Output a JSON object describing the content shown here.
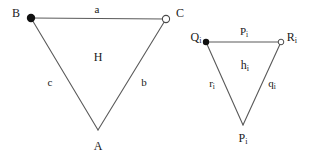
{
  "figure": {
    "background_color": "#ffffff",
    "stroke_color": "#5a5a5a",
    "text_color": "#1a1a1a",
    "left_triangle": {
      "vertices": [
        {
          "name": "B",
          "label": "B",
          "marker": "filled-dot",
          "x": 31,
          "y": 18,
          "label_x": 16,
          "label_y": 13
        },
        {
          "name": "C",
          "label": "C",
          "marker": "open-circle",
          "x": 166,
          "y": 19,
          "label_x": 180,
          "label_y": 13
        },
        {
          "name": "A",
          "label": "A",
          "marker": "none",
          "x": 98,
          "y": 130,
          "label_x": 98,
          "label_y": 146
        }
      ],
      "edges": [
        {
          "name": "a",
          "label": "a",
          "from": "B",
          "to": "C",
          "label_x": 97,
          "label_y": 9
        },
        {
          "name": "b",
          "label": "b",
          "from": "C",
          "to": "A",
          "label_x": 144,
          "label_y": 82
        },
        {
          "name": "c",
          "label": "c",
          "from": "B",
          "to": "A",
          "label_x": 50,
          "label_y": 82
        }
      ],
      "interior_label": {
        "name": "H",
        "label": "H",
        "label_x": 98,
        "label_y": 57
      }
    },
    "right_triangle": {
      "vertices": [
        {
          "name": "Q_i",
          "label": "Q",
          "subscript": "i",
          "marker": "filled-dot",
          "x": 206,
          "y": 42,
          "label_x": 196,
          "label_y": 38
        },
        {
          "name": "R_i",
          "label": "R",
          "subscript": "i",
          "marker": "open-circle",
          "x": 281,
          "y": 42,
          "label_x": 292,
          "label_y": 38
        },
        {
          "name": "P_i",
          "label": "P",
          "subscript": "i",
          "marker": "none",
          "x": 243,
          "y": 125,
          "label_x": 243,
          "label_y": 139
        }
      ],
      "edges": [
        {
          "name": "p_i",
          "label": "P",
          "subscript": "i",
          "from": "Q_i",
          "to": "R_i",
          "label_x": 244,
          "label_y": 32
        },
        {
          "name": "q_i",
          "label": "q",
          "subscript": "i",
          "from": "R_i",
          "to": "P_i",
          "label_x": 272,
          "label_y": 84
        },
        {
          "name": "r_i",
          "label": "r",
          "subscript": "i",
          "from": "Q_i",
          "to": "P_i",
          "label_x": 212,
          "label_y": 84
        }
      ],
      "interior_label": {
        "name": "h_i",
        "label": "h",
        "subscript": "i",
        "label_x": 245,
        "label_y": 66
      }
    }
  }
}
